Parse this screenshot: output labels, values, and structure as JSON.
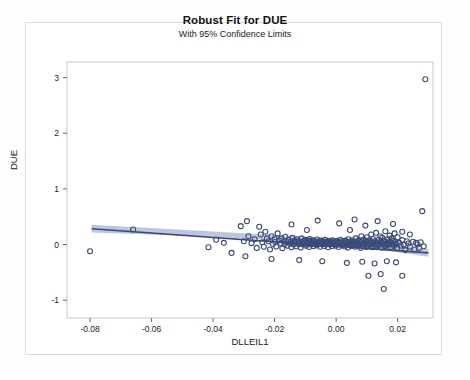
{
  "chart_data": {
    "type": "scatter",
    "title": "Robust Fit for DUE",
    "subtitle": "With 95% Confidence Limits",
    "xlabel": "DLLEIL1",
    "ylabel": "DUE",
    "xlim": [
      -0.0875,
      0.0315
    ],
    "ylim": [
      -1.32,
      3.28
    ],
    "xticks": [
      -0.08,
      -0.06,
      -0.04,
      -0.02,
      0.0,
      0.02
    ],
    "xtick_labels": [
      "-0.08",
      "-0.06",
      "-0.04",
      "-0.02",
      "0.00",
      "0.02"
    ],
    "yticks": [
      -1,
      0,
      1,
      2,
      3
    ],
    "ytick_labels": [
      "-1",
      "0",
      "1",
      "2",
      "3"
    ],
    "grid": false,
    "legend": "none",
    "marker": {
      "shape": "open-circle",
      "diameter_px": 5,
      "stroke": "#3b4b7a",
      "fill": "none",
      "stroke_width": 1.1
    },
    "fit_line": {
      "label": "Robust fit",
      "color": "#3a4a78",
      "width": 1.6,
      "x_start": -0.0795,
      "y_start": 0.285,
      "x_end": 0.03,
      "y_end": -0.15
    },
    "confidence_band": {
      "label": "95% Confidence Limits",
      "color": "#b8c4dc",
      "level": 0.95,
      "upper": [
        [
          -0.0795,
          0.355
        ],
        [
          -0.04,
          0.235
        ],
        [
          0.0,
          0.11
        ],
        [
          0.03,
          -0.08
        ]
      ],
      "lower": [
        [
          -0.0795,
          0.215
        ],
        [
          -0.04,
          0.14
        ],
        [
          0.0,
          0.025
        ],
        [
          0.03,
          -0.22
        ]
      ]
    },
    "points": [
      [
        -0.08,
        -0.12
      ],
      [
        -0.066,
        0.27
      ],
      [
        -0.0415,
        -0.05
      ],
      [
        -0.039,
        0.085
      ],
      [
        -0.0365,
        0.03
      ],
      [
        -0.034,
        -0.15
      ],
      [
        -0.031,
        0.33
      ],
      [
        -0.03,
        0.06
      ],
      [
        -0.0295,
        -0.21
      ],
      [
        -0.0285,
        0.15
      ],
      [
        -0.0275,
        0.025
      ],
      [
        -0.0265,
        0.095
      ],
      [
        -0.0258,
        -0.06
      ],
      [
        -0.025,
        0.32
      ],
      [
        -0.0245,
        0.18
      ],
      [
        -0.024,
        0.04
      ],
      [
        -0.0235,
        -0.04
      ],
      [
        -0.023,
        0.23
      ],
      [
        -0.0225,
        0.11
      ],
      [
        -0.022,
        0.06
      ],
      [
        -0.0215,
        -0.09
      ],
      [
        -0.021,
        0.15
      ],
      [
        -0.0205,
        0.01
      ],
      [
        -0.02,
        0.1
      ],
      [
        -0.0198,
        0.045
      ],
      [
        -0.0195,
        -0.035
      ],
      [
        -0.019,
        0.2
      ],
      [
        -0.0185,
        0.075
      ],
      [
        -0.018,
        0.02
      ],
      [
        -0.0178,
        0.11
      ],
      [
        -0.0175,
        -0.065
      ],
      [
        -0.017,
        0.06
      ],
      [
        -0.0168,
        0.008
      ],
      [
        -0.0165,
        0.14
      ],
      [
        -0.016,
        0.04
      ],
      [
        -0.0158,
        -0.02
      ],
      [
        -0.0155,
        0.085
      ],
      [
        -0.015,
        0.015
      ],
      [
        -0.0148,
        0.055
      ],
      [
        -0.0145,
        -0.05
      ],
      [
        -0.0142,
        0.12
      ],
      [
        -0.014,
        0.03
      ],
      [
        -0.0138,
        0.0
      ],
      [
        -0.0135,
        0.07
      ],
      [
        -0.0132,
        0.045
      ],
      [
        -0.013,
        -0.03
      ],
      [
        -0.0128,
        0.095
      ],
      [
        -0.0125,
        0.02
      ],
      [
        -0.0122,
        0.06
      ],
      [
        -0.012,
        0.005
      ],
      [
        -0.0118,
        0.04
      ],
      [
        -0.0115,
        -0.055
      ],
      [
        -0.0112,
        0.11
      ],
      [
        -0.011,
        0.03
      ],
      [
        -0.0108,
        0.0
      ],
      [
        -0.0105,
        0.065
      ],
      [
        -0.0102,
        0.025
      ],
      [
        -0.01,
        0.085
      ],
      [
        -0.0098,
        -0.02
      ],
      [
        -0.0096,
        0.045
      ],
      [
        -0.0094,
        0.01
      ],
      [
        -0.0092,
        0.07
      ],
      [
        -0.009,
        0.03
      ],
      [
        -0.0088,
        -0.045
      ],
      [
        -0.0086,
        0.1
      ],
      [
        -0.0084,
        0.015
      ],
      [
        -0.0082,
        0.055
      ],
      [
        -0.008,
        0.0
      ],
      [
        -0.0078,
        0.035
      ],
      [
        -0.0076,
        0.075
      ],
      [
        -0.0074,
        -0.03
      ],
      [
        -0.0072,
        0.02
      ],
      [
        -0.007,
        0.06
      ],
      [
        -0.0068,
        0.005
      ],
      [
        -0.0066,
        0.045
      ],
      [
        -0.0064,
        -0.015
      ],
      [
        -0.0062,
        0.09
      ],
      [
        -0.006,
        0.025
      ],
      [
        -0.0058,
        0.0
      ],
      [
        -0.0056,
        0.05
      ],
      [
        -0.0054,
        0.03
      ],
      [
        -0.0052,
        -0.04
      ],
      [
        -0.005,
        0.07
      ],
      [
        -0.0048,
        0.01
      ],
      [
        -0.0046,
        0.04
      ],
      [
        -0.0044,
        0.0
      ],
      [
        -0.0042,
        0.06
      ],
      [
        -0.004,
        0.02
      ],
      [
        -0.0038,
        -0.025
      ],
      [
        -0.0036,
        0.085
      ],
      [
        -0.0034,
        0.035
      ],
      [
        -0.0032,
        0.005
      ],
      [
        -0.003,
        0.05
      ],
      [
        -0.0028,
        0.015
      ],
      [
        -0.0026,
        -0.05
      ],
      [
        -0.0024,
        0.065
      ],
      [
        -0.0022,
        0.025
      ],
      [
        -0.002,
        0.0
      ],
      [
        -0.0018,
        0.045
      ],
      [
        -0.0016,
        0.02
      ],
      [
        -0.0014,
        -0.03
      ],
      [
        -0.0012,
        0.075
      ],
      [
        -0.001,
        0.03
      ],
      [
        -0.0008,
        0.005
      ],
      [
        -0.0006,
        0.055
      ],
      [
        -0.0004,
        0.015
      ],
      [
        -0.0002,
        -0.02
      ],
      [
        0.0,
        0.04
      ],
      [
        0.0002,
        0.0
      ],
      [
        0.0004,
        0.065
      ],
      [
        0.0006,
        0.025
      ],
      [
        0.0008,
        -0.045
      ],
      [
        0.001,
        0.05
      ],
      [
        0.0012,
        0.01
      ],
      [
        0.0014,
        0.085
      ],
      [
        0.0016,
        0.03
      ],
      [
        0.0018,
        -0.015
      ],
      [
        0.002,
        0.06
      ],
      [
        0.0022,
        0.0
      ],
      [
        0.0024,
        0.04
      ],
      [
        0.0026,
        0.02
      ],
      [
        0.0028,
        -0.035
      ],
      [
        0.003,
        0.07
      ],
      [
        0.0032,
        0.015
      ],
      [
        0.0034,
        0.045
      ],
      [
        0.0036,
        0.005
      ],
      [
        0.0038,
        -0.055
      ],
      [
        0.004,
        0.095
      ],
      [
        0.0042,
        0.03
      ],
      [
        0.0044,
        0.0
      ],
      [
        0.0046,
        0.055
      ],
      [
        0.0048,
        0.02
      ],
      [
        0.005,
        -0.025
      ],
      [
        0.0052,
        0.075
      ],
      [
        0.0054,
        0.035
      ],
      [
        0.0056,
        0.0
      ],
      [
        0.0058,
        0.05
      ],
      [
        0.006,
        0.015
      ],
      [
        0.0062,
        -0.04
      ],
      [
        0.0064,
        0.11
      ],
      [
        0.0066,
        0.03
      ],
      [
        0.0068,
        0.06
      ],
      [
        0.007,
        0.0
      ],
      [
        0.0072,
        -0.02
      ],
      [
        0.0074,
        0.08
      ],
      [
        0.0076,
        0.04
      ],
      [
        0.0078,
        0.01
      ],
      [
        0.008,
        -0.06
      ],
      [
        0.0082,
        0.15
      ],
      [
        0.0084,
        0.055
      ],
      [
        0.0086,
        0.02
      ],
      [
        0.0088,
        -0.03
      ],
      [
        0.009,
        0.09
      ],
      [
        0.0092,
        0.035
      ],
      [
        0.0094,
        0.0
      ],
      [
        0.0096,
        0.065
      ],
      [
        0.0098,
        -0.045
      ],
      [
        0.01,
        0.13
      ],
      [
        0.0102,
        0.045
      ],
      [
        0.0104,
        0.01
      ],
      [
        0.0106,
        -0.025
      ],
      [
        0.0108,
        0.075
      ],
      [
        0.011,
        0.03
      ],
      [
        0.0112,
        0.0
      ],
      [
        0.0114,
        0.18
      ],
      [
        0.0116,
        0.055
      ],
      [
        0.0118,
        -0.05
      ],
      [
        0.012,
        0.1
      ],
      [
        0.0122,
        0.025
      ],
      [
        0.0124,
        0.0
      ],
      [
        0.0126,
        0.06
      ],
      [
        0.0128,
        -0.035
      ],
      [
        0.013,
        0.21
      ],
      [
        0.0132,
        0.04
      ],
      [
        0.0134,
        0.015
      ],
      [
        0.0136,
        -0.02
      ],
      [
        0.0138,
        0.085
      ],
      [
        0.014,
        0.03
      ],
      [
        0.0142,
        0.0
      ],
      [
        0.0144,
        0.15
      ],
      [
        0.0146,
        0.055
      ],
      [
        0.0148,
        -0.055
      ],
      [
        0.015,
        0.12
      ],
      [
        0.0152,
        0.02
      ],
      [
        0.0154,
        0.0
      ],
      [
        0.0156,
        0.07
      ],
      [
        0.0158,
        -0.03
      ],
      [
        0.016,
        0.24
      ],
      [
        0.0162,
        0.045
      ],
      [
        0.0164,
        0.01
      ],
      [
        0.0166,
        -0.015
      ],
      [
        0.0168,
        0.095
      ],
      [
        0.017,
        0.035
      ],
      [
        0.0172,
        0.0
      ],
      [
        0.0174,
        0.16
      ],
      [
        0.0176,
        0.05
      ],
      [
        0.0178,
        -0.045
      ],
      [
        0.018,
        0.11
      ],
      [
        0.0182,
        0.025
      ],
      [
        0.0184,
        0.0
      ],
      [
        0.0186,
        0.065
      ],
      [
        0.0188,
        -0.025
      ],
      [
        0.019,
        0.2
      ],
      [
        0.0192,
        0.04
      ],
      [
        0.0195,
        0.01
      ],
      [
        0.0198,
        -0.06
      ],
      [
        0.02,
        0.13
      ],
      [
        0.0205,
        0.03
      ],
      [
        0.021,
        -0.02
      ],
      [
        0.0215,
        0.08
      ],
      [
        0.022,
        0.0
      ],
      [
        0.0225,
        -0.1
      ],
      [
        0.023,
        0.06
      ],
      [
        0.0235,
        0.02
      ],
      [
        0.024,
        -0.04
      ],
      [
        0.025,
        0.05
      ],
      [
        0.0255,
        -0.09
      ],
      [
        0.026,
        0.03
      ],
      [
        0.0265,
        0.0
      ],
      [
        0.027,
        -0.06
      ],
      [
        0.0275,
        0.04
      ],
      [
        0.028,
        0.6
      ],
      [
        0.0285,
        -0.03
      ],
      [
        0.029,
        2.97
      ],
      [
        -0.021,
        -0.26
      ],
      [
        -0.012,
        -0.28
      ],
      [
        -0.0045,
        -0.3
      ],
      [
        0.0035,
        -0.33
      ],
      [
        0.0085,
        -0.31
      ],
      [
        0.0125,
        -0.34
      ],
      [
        0.0165,
        -0.3
      ],
      [
        0.0195,
        -0.32
      ],
      [
        0.0105,
        -0.56
      ],
      [
        0.0145,
        -0.53
      ],
      [
        0.0155,
        -0.8
      ],
      [
        0.0215,
        -0.56
      ],
      [
        -0.029,
        0.42
      ],
      [
        -0.0145,
        0.36
      ],
      [
        -0.006,
        0.43
      ],
      [
        0.001,
        0.38
      ],
      [
        0.006,
        0.45
      ],
      [
        0.0095,
        0.34
      ],
      [
        0.0135,
        0.42
      ],
      [
        0.0185,
        0.37
      ],
      [
        0.0045,
        0.26
      ],
      [
        -0.0095,
        0.26
      ],
      [
        0.0215,
        0.23
      ],
      [
        0.024,
        0.18
      ]
    ]
  }
}
